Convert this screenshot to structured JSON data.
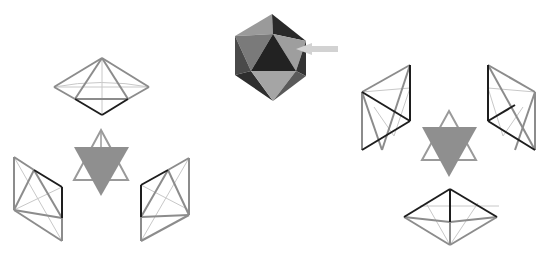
{
  "figure": {
    "colors": {
      "background": "#ffffff",
      "light_edge": "#c8c8c8",
      "mid_edge": "#8c8c8c",
      "dark_edge": "#1e1e1e",
      "star_fill": "#8f8f8f",
      "ico_light": "#9a9a9a",
      "ico_mid": "#6e6e6e",
      "ico_dark": "#2a2a2a",
      "arrow": "#d2d2d2"
    },
    "icosahedron": {
      "label": "icosahedron",
      "pointer": "arrow pointing to face"
    },
    "left_group": {
      "label": "left assembly",
      "pieces": [
        "top bipyramid",
        "bottom-left bipyramid",
        "bottom-right bipyramid"
      ],
      "center": "star tetrahedron (downward filled)"
    },
    "right_group": {
      "label": "right assembly",
      "pieces": [
        "top-left bipyramid",
        "top-right bipyramid",
        "bottom bipyramid"
      ],
      "center": "star tetrahedron (downward filled)"
    }
  }
}
